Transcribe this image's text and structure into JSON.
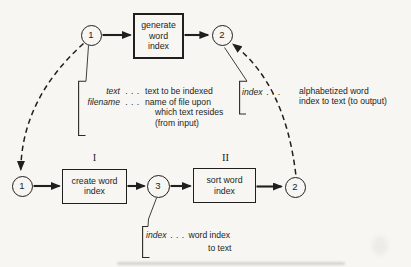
{
  "palette": {
    "ink": "#211f1d",
    "paper": "#f7f6f2"
  },
  "flow": {
    "top": {
      "start_circle": "1",
      "process": "generate\nword\nindex",
      "end_circle": "2"
    },
    "bottom": {
      "start_circle": "1",
      "stage1_numeral": "I",
      "stage1_process": "create word\nindex",
      "mid_circle": "3",
      "stage2_numeral": "II",
      "stage2_process": "sort word\nindex",
      "end_circle": "2"
    }
  },
  "annotations": {
    "input": {
      "term1": "text",
      "dots1": ". . .",
      "desc1": "text to be indexed",
      "term2": "filename",
      "dots2": ". . .",
      "desc2": "name of file upon",
      "desc3": "which text resides",
      "desc4": "(from input)"
    },
    "output": {
      "term": "index",
      "dots": ". . .",
      "desc": "alphabetized word\nindex to text (to output)"
    },
    "intermediate": {
      "term": "index",
      "dots": ". . .",
      "desc1": "word index",
      "desc2": "to text"
    }
  }
}
